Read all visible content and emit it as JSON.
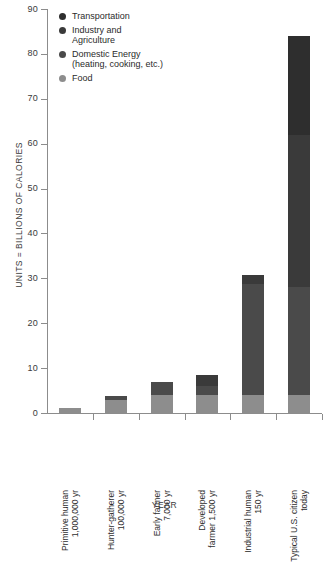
{
  "chart_data": {
    "type": "bar",
    "title": "",
    "xlabel": "YEAR",
    "ylabel": "UNITS = BILLIONS OF CALORIES",
    "ylim": [
      0,
      90
    ],
    "yticks": [
      0,
      10,
      20,
      30,
      40,
      50,
      60,
      70,
      80,
      90
    ],
    "ytick_labels": [
      "0",
      "10",
      "20",
      "30",
      "40",
      "50",
      "60",
      "70",
      "80",
      "90"
    ],
    "grid": false,
    "stacked": true,
    "legend_position": "top-left",
    "categories": [
      "Primitive human 1,000,000 yr",
      "Hunter-gatherer 100,000 yr",
      "Early farmer 7,000 yr",
      "Developed farmer 1,500 yr",
      "Industrial human 150 yr",
      "Typical U.S. citizen today"
    ],
    "series": [
      {
        "name": "Food",
        "color": "#8d8d8d",
        "values": [
          1.2,
          3.0,
          4.0,
          4.0,
          4.0,
          4.0
        ]
      },
      {
        "name": "Domestic Energy (heating, cooking, etc.)",
        "color": "#4a4a4a",
        "values": [
          0,
          0.8,
          3.0,
          2.0,
          24.7,
          24.0
        ]
      },
      {
        "name": "Industry and Agriculture",
        "color": "#3a3a3a",
        "values": [
          0,
          0,
          0,
          2.5,
          2.0,
          34.0
        ]
      },
      {
        "name": "Transportation",
        "color": "#2e2e2e",
        "values": [
          0,
          0,
          0,
          0,
          0,
          22.0
        ]
      }
    ],
    "totals": [
      1.2,
      3.8,
      7.0,
      8.5,
      30.7,
      84.0
    ]
  },
  "legend": {
    "items": [
      {
        "label_line1": "Transportation",
        "label_line2": "",
        "color": "#2e2e2e"
      },
      {
        "label_line1": "Industry and",
        "label_line2": "Agriculture",
        "color": "#3a3a3a"
      },
      {
        "label_line1": "Domestic Energy",
        "label_line2": "(heating, cooking, etc.)",
        "color": "#4a4a4a"
      },
      {
        "label_line1": "Food",
        "label_line2": "",
        "color": "#8d8d8d"
      }
    ]
  },
  "axes": {
    "y_title": "UNITS = BILLIONS OF CALORIES",
    "x_title": "YEAR",
    "y_labels": [
      "90",
      "80",
      "70",
      "60",
      "50",
      "40",
      "30",
      "20",
      "10",
      "0"
    ],
    "x_labels": [
      {
        "line1": "Primitive human",
        "line2": "1,000,000 yr"
      },
      {
        "line1": "Hunter-gatherer",
        "line2": "100,000 yr"
      },
      {
        "line1": "Early farmer",
        "line2": "7,000 yr"
      },
      {
        "line1": "Developed",
        "line2": "farmer 1,500 yr"
      },
      {
        "line1": "Industrial human",
        "line2": "150 yr"
      },
      {
        "line1": "Typical U.S. citizen",
        "line2": "today"
      }
    ]
  },
  "colors": {
    "axis": "#8c8c8c",
    "text": "#2b2b2b",
    "background": "#ffffff"
  }
}
